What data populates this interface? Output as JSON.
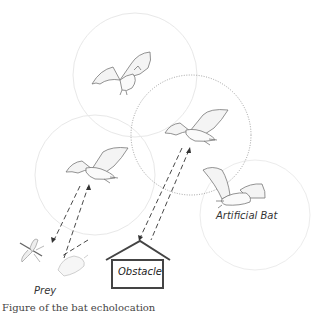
{
  "diagram": {
    "labels": {
      "prey": "Prey",
      "obstacle": "Obstacle",
      "artificial_bat": "Artificial Bat"
    },
    "caption_fragment": "Figure of the bat echolocation",
    "circles": [
      {
        "id": "bat-top-range",
        "cx": 135,
        "cy": 75,
        "r": 62,
        "style": "faint"
      },
      {
        "id": "bat-middle-range",
        "cx": 191,
        "cy": 135,
        "r": 60,
        "style": "dotted"
      },
      {
        "id": "bat-left-range",
        "cx": 95,
        "cy": 175,
        "r": 60,
        "style": "faint"
      },
      {
        "id": "bat-right-range",
        "cx": 255,
        "cy": 215,
        "r": 55,
        "style": "faint"
      }
    ],
    "colors": {
      "sketch": "#777777",
      "faint_circle": "#e6e6e6",
      "dotted_circle": "#888888",
      "obstacle_stroke": "#444444",
      "text": "#333333"
    }
  }
}
